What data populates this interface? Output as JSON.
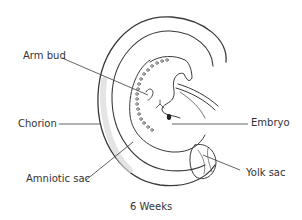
{
  "diagram": {
    "title": "6 Weeks",
    "labels": {
      "arm_bud": "Arm bud",
      "chorion": "Chorion",
      "amniotic_sac": "Amniotic sac",
      "embryo": "Embryo",
      "yolk_sac": "Yolk sac"
    },
    "colors": {
      "line": "#3a3a3a",
      "text": "#333333",
      "shade": "#d8d8d8"
    }
  }
}
